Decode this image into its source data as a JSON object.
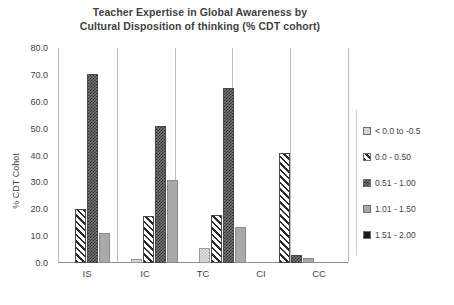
{
  "chart_data": {
    "type": "bar",
    "title": "Teacher Expertise in Global Awareness by Cultural Disposition of thinking (% CDT cohort)",
    "title_lines": [
      "Teacher Expertise in Global Awareness by",
      "Cultural Disposition of thinking (% CDT cohort)"
    ],
    "xlabel": "",
    "ylabel": "% CDT Cohot",
    "ylim": [
      0,
      80
    ],
    "ytick_labels": [
      "0.0",
      "10.0",
      "20.0",
      "30.0",
      "40.0",
      "50.0",
      "60.0",
      "70.0",
      "80.0"
    ],
    "ytick_values": [
      0,
      10,
      20,
      30,
      40,
      50,
      60,
      70,
      80
    ],
    "grid": false,
    "category_separators": true,
    "legend_position": "right",
    "categories": [
      "IS",
      "IC",
      "TC",
      "CI",
      "CC"
    ],
    "series": [
      {
        "name": "< 0.0 to -0.5",
        "pattern": "light-dotted",
        "values": [
          0,
          1.5,
          5.5,
          0,
          0
        ]
      },
      {
        "name": "0.0 - 0.50",
        "pattern": "diagonal-hatch",
        "values": [
          20.2,
          17.5,
          18.0,
          41.0,
          0
        ]
      },
      {
        "name": "0.51 - 1.00",
        "pattern": "dark-checker",
        "values": [
          70.5,
          51.0,
          65.0,
          3.0,
          0
        ]
      },
      {
        "name": "1.01 - 1.50",
        "pattern": "solid-gray",
        "values": [
          11.0,
          31.0,
          13.5,
          2.0,
          0
        ]
      },
      {
        "name": "1.51 - 2.00",
        "pattern": "solid-black",
        "values": [
          0,
          0,
          0,
          0,
          0
        ]
      }
    ]
  },
  "legend": {
    "items": [
      {
        "label": "< 0.0 to -0.5"
      },
      {
        "label": "0.0 - 0.50"
      },
      {
        "label": "0.51 - 1.00"
      },
      {
        "label": "1.01 - 1.50"
      },
      {
        "label": "1.51 - 2.00"
      }
    ]
  },
  "colors": {
    "text": "#3f3f3f",
    "axis": "#8d8d8d",
    "separator": "#bdbdbd",
    "light_dotted": "#e2e2e2",
    "hatch": "#2b2b2b",
    "checker": "#2e2e2e",
    "solid_gray": "#a9a9a9",
    "solid_black": "#1a1a1a"
  }
}
